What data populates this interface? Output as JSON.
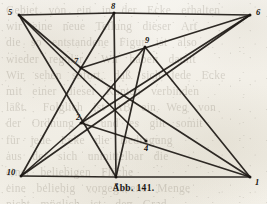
{
  "figure": {
    "caption": "Abb. 141.",
    "width": 267,
    "height": 204,
    "ink_color": "#1e1a16",
    "paper_color": "#f2efe7"
  },
  "bleed_through": {
    "text": "Gebiet  von  ein  in  der  Ecke  erhalten\nwir  eine  neue  Teilung  dieser  Art\ndie  so  entstandene  Figur  ist  also\nwieder  regulär.   Wir  haben  damit\nWir  sehen  sofort,  daß  sich  jede  Ecke\nmit  einer  dieser  Kanten  verbinden\nläßt.   Folglich  ist  AB  ein  Weg  von\nder  Ordnung  k  und  es  gilt  somit\nfür  jede  Ecke  die  Bedingung\naus  der  sich  unmittelbar  die\neiner  beliebigen  Fläche\neine  beliebig  vorgegebene  Menge\nnicht  möglich  ist,  den  Grad\neiner  Ecke  so  zu  wählen,  daß  man  die\nzusammenhängende  Figur  erhält"
  },
  "graph_data": {
    "type": "graph",
    "title": "Abb. 141.",
    "description": "Straight-line drawing of a graph on ten labeled vertices.",
    "nodes": [
      {
        "id": "5",
        "label": "5",
        "x": 19,
        "y": 15,
        "label_x": 10,
        "label_y": 12
      },
      {
        "id": "8",
        "label": "8",
        "x": 114,
        "y": 13,
        "label_x": 113,
        "label_y": 6
      },
      {
        "id": "6",
        "label": "6",
        "x": 250,
        "y": 15,
        "label_x": 258,
        "label_y": 12
      },
      {
        "id": "9",
        "label": "9",
        "x": 145,
        "y": 47,
        "label_x": 147,
        "label_y": 40
      },
      {
        "id": "7",
        "label": "7",
        "x": 81,
        "y": 68,
        "label_x": 76,
        "label_y": 61
      },
      {
        "id": "2",
        "label": "2",
        "x": 81,
        "y": 123,
        "label_x": 78,
        "label_y": 117
      },
      {
        "id": "4",
        "label": "4",
        "x": 146,
        "y": 141,
        "label_x": 146,
        "label_y": 148
      },
      {
        "id": "10",
        "label": "10",
        "x": 21,
        "y": 176,
        "label_x": 11,
        "label_y": 172
      },
      {
        "id": "3",
        "label": "3",
        "x": 116,
        "y": 177,
        "label_x": 116,
        "label_y": 186
      },
      {
        "id": "1",
        "label": "1",
        "x": 250,
        "y": 177,
        "label_x": 257,
        "label_y": 182
      }
    ],
    "edges": [
      {
        "from": "5",
        "to": "8"
      },
      {
        "from": "8",
        "to": "6"
      },
      {
        "from": "10",
        "to": "3"
      },
      {
        "from": "3",
        "to": "1"
      },
      {
        "from": "5",
        "to": "7"
      },
      {
        "from": "5",
        "to": "4"
      },
      {
        "from": "5",
        "to": "3"
      },
      {
        "from": "6",
        "to": "7"
      },
      {
        "from": "6",
        "to": "2"
      },
      {
        "from": "6",
        "to": "10"
      },
      {
        "from": "8",
        "to": "7"
      },
      {
        "from": "8",
        "to": "3"
      },
      {
        "from": "7",
        "to": "10"
      },
      {
        "from": "7",
        "to": "1"
      },
      {
        "from": "2",
        "to": "10"
      },
      {
        "from": "2",
        "to": "1"
      },
      {
        "from": "2",
        "to": "9"
      },
      {
        "from": "9",
        "to": "1"
      },
      {
        "from": "9",
        "to": "3"
      }
    ],
    "node_count": 10,
    "edge_count": 19
  }
}
